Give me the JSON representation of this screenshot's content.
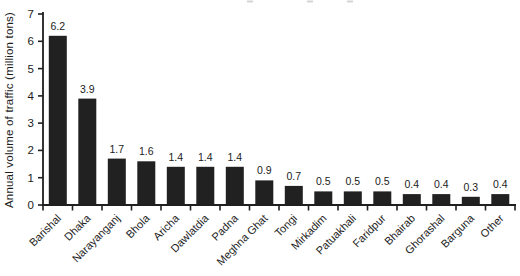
{
  "figure": {
    "background": "#ffffff",
    "bar_color": "#212121",
    "axis_color": "#1f1f1f",
    "text_color": "#1c1c1c",
    "scan_artifact_color": "#b9b9b9"
  },
  "chart_data": {
    "type": "bar",
    "title": "",
    "xlabel": "",
    "ylabel": "Annual volume of traffic (million tons)",
    "ylim": [
      0,
      7
    ],
    "yticks": [
      0,
      1,
      2,
      3,
      4,
      5,
      6,
      7
    ],
    "grid": false,
    "legend": null,
    "categories": [
      "Barishal",
      "Dhaka",
      "Narayanganj",
      "Bhola",
      "Aricha",
      "Dawlatdia",
      "Padna",
      "Meghna Ghat",
      "Tongi",
      "Mirkadim",
      "Patuakhali",
      "Faridpur",
      "Bhairab",
      "Ghorashal",
      "Barguna",
      "Other"
    ],
    "values": [
      6.2,
      3.9,
      1.7,
      1.6,
      1.4,
      1.4,
      1.4,
      0.9,
      0.7,
      0.5,
      0.5,
      0.5,
      0.4,
      0.4,
      0.3,
      0.4
    ],
    "value_labels": [
      "6.2",
      "3.9",
      "1.7",
      "1.6",
      "1.4",
      "1.4",
      "1.4",
      "0.9",
      "0.7",
      "0.5",
      "0.5",
      "0.5",
      "0.4",
      "0.4",
      "0.3",
      "0.4"
    ]
  },
  "scan_artifacts": {
    "top_edge_marks_x": [
      247,
      307,
      347
    ]
  }
}
